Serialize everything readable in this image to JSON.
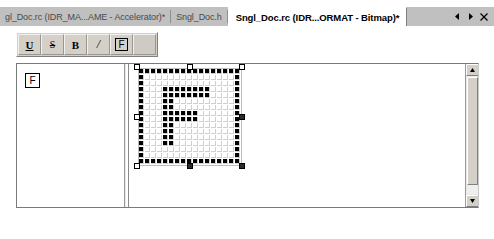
{
  "window": {
    "background_color": "#ffffff",
    "chrome_color": "#c0c0c0"
  },
  "tabs": {
    "items": [
      {
        "label": "gl_Doc.rc (IDR_MA...AME - Accelerator)*",
        "active": false
      },
      {
        "label": "Sngl_Doc.h",
        "active": false
      },
      {
        "label": "Sngl_Doc.rc (IDR...ORMAT - Bitmap)*",
        "active": true
      }
    ],
    "nav": {
      "prev_label": "◀",
      "next_label": "▶",
      "close_label": "✕"
    }
  },
  "toolbar": {
    "buttons": [
      {
        "name": "underline-button",
        "label": "U"
      },
      {
        "name": "strikethrough-button",
        "label": "S"
      },
      {
        "name": "bold-button",
        "label": "B"
      },
      {
        "name": "italic-button",
        "label": "/"
      },
      {
        "name": "framed-glyph-button",
        "label": "F"
      },
      {
        "name": "blank-button",
        "label": ""
      }
    ]
  },
  "left_pane": {
    "glyph_preview_label": "F"
  },
  "editor": {
    "grid_cols": 17,
    "grid_rows": 16,
    "cell_size": 5,
    "bitmap": [
      [
        1,
        1,
        1,
        1,
        1,
        1,
        1,
        1,
        1,
        1,
        1,
        1,
        1,
        1,
        1,
        1,
        1
      ],
      [
        1,
        0,
        0,
        0,
        0,
        0,
        0,
        0,
        0,
        0,
        0,
        0,
        0,
        0,
        0,
        0,
        1
      ],
      [
        1,
        0,
        0,
        0,
        0,
        0,
        0,
        0,
        0,
        0,
        0,
        0,
        0,
        0,
        0,
        0,
        1
      ],
      [
        1,
        0,
        0,
        0,
        1,
        1,
        1,
        1,
        1,
        1,
        1,
        1,
        0,
        0,
        0,
        0,
        1
      ],
      [
        1,
        0,
        0,
        0,
        1,
        1,
        1,
        1,
        1,
        1,
        1,
        1,
        0,
        0,
        0,
        0,
        1
      ],
      [
        1,
        0,
        0,
        0,
        1,
        1,
        0,
        0,
        0,
        0,
        0,
        0,
        0,
        0,
        0,
        0,
        1
      ],
      [
        1,
        0,
        0,
        0,
        1,
        1,
        0,
        0,
        0,
        0,
        0,
        0,
        0,
        0,
        0,
        0,
        1
      ],
      [
        1,
        0,
        0,
        0,
        1,
        1,
        1,
        1,
        1,
        1,
        0,
        0,
        0,
        0,
        0,
        0,
        1
      ],
      [
        1,
        0,
        0,
        0,
        1,
        1,
        1,
        1,
        1,
        1,
        0,
        0,
        0,
        0,
        0,
        0,
        1
      ],
      [
        1,
        0,
        0,
        0,
        1,
        1,
        0,
        0,
        0,
        0,
        0,
        0,
        0,
        0,
        0,
        0,
        1
      ],
      [
        1,
        0,
        0,
        0,
        1,
        1,
        0,
        0,
        0,
        0,
        0,
        0,
        0,
        0,
        0,
        0,
        1
      ],
      [
        1,
        0,
        0,
        0,
        1,
        1,
        0,
        0,
        0,
        0,
        0,
        0,
        0,
        0,
        0,
        0,
        1
      ],
      [
        1,
        0,
        0,
        0,
        1,
        1,
        0,
        0,
        0,
        0,
        0,
        0,
        0,
        0,
        0,
        0,
        1
      ],
      [
        1,
        0,
        0,
        0,
        0,
        0,
        0,
        0,
        0,
        0,
        0,
        0,
        0,
        0,
        0,
        0,
        1
      ],
      [
        1,
        0,
        0,
        0,
        0,
        0,
        0,
        0,
        0,
        0,
        0,
        0,
        0,
        0,
        0,
        0,
        1
      ],
      [
        1,
        1,
        1,
        1,
        1,
        1,
        1,
        1,
        1,
        1,
        1,
        1,
        1,
        1,
        1,
        1,
        1
      ]
    ]
  },
  "scrollbar": {
    "up_label": "▲",
    "down_label": "▼"
  }
}
